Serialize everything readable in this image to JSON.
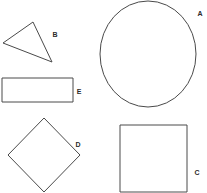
{
  "figure": {
    "background_color": "#ffffff",
    "stroke_color": "#4a4a4a",
    "label_color": "#2b2b2b",
    "width": 207,
    "height": 193,
    "shape_count": 5
  },
  "shapes": [
    {
      "id": "circle-a",
      "label": "A",
      "type": "circle",
      "label_x": 200,
      "label_y": 14,
      "center_x": 148,
      "center_y": 54,
      "radius_x": 48,
      "radius_y": 53
    },
    {
      "id": "triangle-b",
      "label": "B",
      "type": "triangle",
      "label_x": 55,
      "label_y": 35,
      "points": "33,22 52,62 3,43"
    },
    {
      "id": "square-c",
      "label": "C",
      "type": "square",
      "label_x": 197,
      "label_y": 173,
      "x": 120,
      "y": 125,
      "width": 67,
      "height": 67
    },
    {
      "id": "diamond-d",
      "label": "D",
      "type": "diamond",
      "label_x": 78,
      "label_y": 145,
      "points": "44,118 80,155 44,192 8,155"
    },
    {
      "id": "rectangle-e",
      "label": "E",
      "type": "rectangle",
      "label_x": 79,
      "label_y": 92,
      "x": 2,
      "y": 78,
      "width": 71,
      "height": 24
    }
  ]
}
